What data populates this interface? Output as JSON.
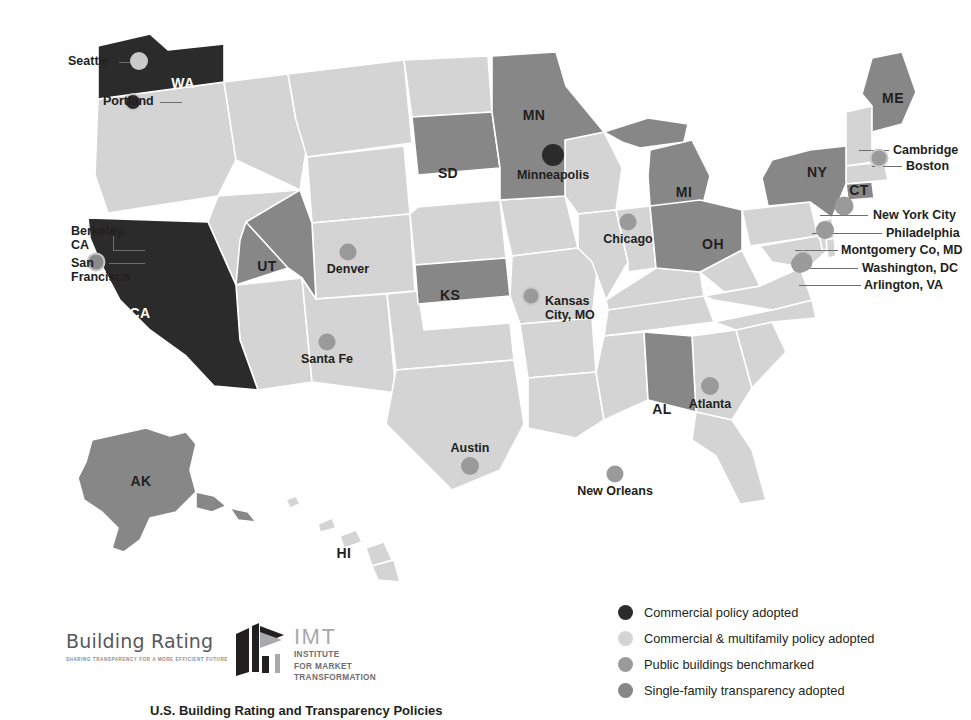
{
  "colors": {
    "dark": "#2b2b2b",
    "mid_dark": "#878787",
    "light": "#d4d4d4",
    "dot_dark": "#2b2b2b",
    "dot_light": "#c9c9c9",
    "dot_mid": "#9a9a9a",
    "dot_mid_dark": "#8a8a8a",
    "leader": "#6d6e71",
    "text": "#231f20",
    "state_border": "#ffffff",
    "background": "#ffffff"
  },
  "map": {
    "states": [
      {
        "abbr": "WA",
        "label_x": 183,
        "label_y": 83,
        "tint": "dark",
        "on_dark": true
      },
      {
        "abbr": "CA",
        "label_x": 140,
        "label_y": 313,
        "tint": "dark",
        "on_dark": true
      },
      {
        "abbr": "UT",
        "label_x": 267,
        "label_y": 266,
        "tint": "mid_dark",
        "on_dark": false
      },
      {
        "abbr": "SD",
        "label_x": 448,
        "label_y": 173,
        "tint": "mid_dark",
        "on_dark": false
      },
      {
        "abbr": "MN",
        "label_x": 534,
        "label_y": 115,
        "tint": "mid_dark",
        "on_dark": false
      },
      {
        "abbr": "MI",
        "label_x": 684,
        "label_y": 192,
        "tint": "mid_dark",
        "on_dark": false
      },
      {
        "abbr": "OH",
        "label_x": 713,
        "label_y": 244,
        "tint": "mid_dark",
        "on_dark": false
      },
      {
        "abbr": "KS",
        "label_x": 450,
        "label_y": 295,
        "tint": "mid_dark",
        "on_dark": false
      },
      {
        "abbr": "AL",
        "label_x": 662,
        "label_y": 409,
        "tint": "mid_dark",
        "on_dark": false
      },
      {
        "abbr": "NY",
        "label_x": 817,
        "label_y": 172,
        "tint": "mid_dark",
        "on_dark": false
      },
      {
        "abbr": "ME",
        "label_x": 893,
        "label_y": 98,
        "tint": "mid_dark",
        "on_dark": false
      },
      {
        "abbr": "CT",
        "label_x": 859,
        "label_y": 190,
        "tint": "mid_dark",
        "on_dark": false
      },
      {
        "abbr": "AK",
        "label_x": 141,
        "label_y": 481,
        "tint": "mid_dark",
        "on_dark": false
      },
      {
        "abbr": "HI",
        "label_x": 344,
        "label_y": 553,
        "tint": "light",
        "on_dark": false
      }
    ],
    "cities": [
      {
        "name": "Seattle",
        "dot_x": 139,
        "dot_y": 61,
        "r": 9,
        "fill": "dot_light",
        "ring": "none",
        "label_x": 68,
        "label_y": 54,
        "align": "left",
        "text": "Seattle"
      },
      {
        "name": "Portland",
        "dot_x": 133,
        "dot_y": 102,
        "r": 9,
        "fill": "dot_dark",
        "ring": "dot_light",
        "label_x": 103,
        "label_y": 94,
        "align": "left",
        "text": "Portland"
      },
      {
        "name": "Berkeley, CA",
        "dot_x": 96,
        "dot_y": 262,
        "r": 9.5,
        "fill": "dot_mid_dark",
        "ring": "dot_light",
        "label_x": 71,
        "label_y": 224,
        "align": "left",
        "text": "Berkeley,\nCA"
      },
      {
        "name": "San Francisco",
        "dot_x": 96,
        "dot_y": 262,
        "r": 9.5,
        "fill": "dot_mid_dark",
        "ring": "dot_light",
        "label_x": 71,
        "label_y": 256,
        "align": "left",
        "text": "San\nFrancisco"
      },
      {
        "name": "Denver",
        "dot_x": 348,
        "dot_y": 252,
        "r": 8.5,
        "fill": "dot_mid",
        "ring": "none",
        "label_x": 348,
        "label_y": 262,
        "align": "center",
        "text": "Denver"
      },
      {
        "name": "Santa Fe",
        "dot_x": 327,
        "dot_y": 342,
        "r": 8.5,
        "fill": "dot_mid",
        "ring": "none",
        "label_x": 327,
        "label_y": 352,
        "align": "center",
        "text": "Santa Fe"
      },
      {
        "name": "Minneapolis",
        "dot_x": 553,
        "dot_y": 155,
        "r": 11,
        "fill": "dot_dark",
        "ring": "none",
        "label_x": 553,
        "label_y": 168,
        "align": "center",
        "text": "Minneapolis"
      },
      {
        "name": "Chicago",
        "dot_x": 628,
        "dot_y": 222,
        "r": 8.5,
        "fill": "dot_mid",
        "ring": "none",
        "label_x": 628,
        "label_y": 232,
        "align": "center",
        "text": "Chicago"
      },
      {
        "name": "Kansas City, MO",
        "dot_x": 531,
        "dot_y": 296,
        "r": 9.5,
        "fill": "dot_mid",
        "ring": "dot_light",
        "label_x": 545,
        "label_y": 294,
        "align": "left",
        "text": "Kansas\nCity, MO"
      },
      {
        "name": "Austin",
        "dot_x": 470,
        "dot_y": 466,
        "r": 9,
        "fill": "dot_mid",
        "ring": "none",
        "label_x": 470,
        "label_y": 441,
        "align": "center",
        "text": "Austin"
      },
      {
        "name": "New Orleans",
        "dot_x": 615,
        "dot_y": 474,
        "r": 8.5,
        "fill": "dot_mid",
        "ring": "none",
        "label_x": 615,
        "label_y": 484,
        "align": "center",
        "text": "New Orleans"
      },
      {
        "name": "Atlanta",
        "dot_x": 710,
        "dot_y": 386,
        "r": 9,
        "fill": "dot_mid",
        "ring": "none",
        "label_x": 710,
        "label_y": 397,
        "align": "center",
        "text": "Atlanta"
      },
      {
        "name": "Cambridge",
        "dot_x": 879,
        "dot_y": 158,
        "r": 9.5,
        "fill": "dot_mid",
        "ring": "dot_light",
        "label_x": 893,
        "label_y": 143,
        "align": "left",
        "text": "Cambridge"
      },
      {
        "name": "Boston",
        "dot_x": 879,
        "dot_y": 158,
        "r": 9.5,
        "fill": "dot_mid",
        "ring": "dot_light",
        "label_x": 906,
        "label_y": 159,
        "align": "left",
        "text": "Boston"
      },
      {
        "name": "New York City",
        "dot_x": 844,
        "dot_y": 206,
        "r": 9.5,
        "fill": "dot_mid",
        "ring": "none",
        "label_x": 873,
        "label_y": 208,
        "align": "left",
        "text": "New York City"
      },
      {
        "name": "Philadelphia",
        "dot_x": 825,
        "dot_y": 230,
        "r": 9,
        "fill": "dot_mid",
        "ring": "none",
        "label_x": 886,
        "label_y": 226,
        "align": "left",
        "text": "Philadelphia"
      },
      {
        "name": "Montgomery Co, MD",
        "dot_x": 803,
        "dot_y": 260,
        "r": 9.5,
        "fill": "dot_mid",
        "ring": "dot_light",
        "label_x": 841,
        "label_y": 243,
        "align": "left",
        "text": "Montgomery Co, MD"
      },
      {
        "name": "Washington, DC",
        "dot_x": 803,
        "dot_y": 262,
        "r": 9.5,
        "fill": "dot_mid",
        "ring": "none",
        "label_x": 862,
        "label_y": 261,
        "align": "left",
        "text": "Washington, DC"
      },
      {
        "name": "Arlington, VA",
        "dot_x": 800,
        "dot_y": 264,
        "r": 9,
        "fill": "dot_mid",
        "ring": "none",
        "label_x": 864,
        "label_y": 278,
        "align": "left",
        "text": "Arlington, VA"
      }
    ],
    "leaders": [
      {
        "id": "seattle",
        "x": 119,
        "y": 62,
        "len": 22,
        "dir": "h"
      },
      {
        "id": "portland",
        "x": 160,
        "y": 102,
        "len": 22,
        "dir": "h"
      },
      {
        "id": "berkeley-h",
        "x": 113,
        "y": 250,
        "len": 32,
        "dir": "h"
      },
      {
        "id": "berkeley-v",
        "x": 113,
        "y": 236,
        "len": 15,
        "dir": "v"
      },
      {
        "id": "sanfran",
        "x": 109,
        "y": 263,
        "len": 36,
        "dir": "h"
      },
      {
        "id": "cambridge",
        "x": 859,
        "y": 150,
        "len": 30,
        "dir": "h"
      },
      {
        "id": "boston",
        "x": 872,
        "y": 166,
        "len": 30,
        "dir": "h"
      },
      {
        "id": "newyork",
        "x": 820,
        "y": 215,
        "len": 48,
        "dir": "h"
      },
      {
        "id": "philadelphia",
        "x": 812,
        "y": 233,
        "len": 70,
        "dir": "h"
      },
      {
        "id": "montgomery",
        "x": 795,
        "y": 250,
        "len": 43,
        "dir": "h"
      },
      {
        "id": "washington",
        "x": 806,
        "y": 268,
        "len": 52,
        "dir": "h"
      },
      {
        "id": "arlington",
        "x": 799,
        "y": 285,
        "len": 62,
        "dir": "h"
      }
    ]
  },
  "legend": {
    "items": [
      {
        "label": "Commercial policy adopted",
        "color_key": "dark"
      },
      {
        "label": "Commercial & multifamily policy adopted",
        "color_key": "light"
      },
      {
        "label": "Public buildings benchmarked",
        "color_key": "dot_mid"
      },
      {
        "label": "Single-family transparency adopted",
        "color_key": "mid_dark"
      }
    ]
  },
  "footer": {
    "building_rating": {
      "name": "Building Rating",
      "tagline": "SHARING TRANSPARENCY FOR A MORE EFFICIENT FUTURE"
    },
    "imt": {
      "acronym": "IMT",
      "line1": "INSTITUTE",
      "line2": "FOR MARKET",
      "line3": "TRANSFORMATION"
    }
  },
  "caption": "U.S. Building Rating and Transparency Policies"
}
